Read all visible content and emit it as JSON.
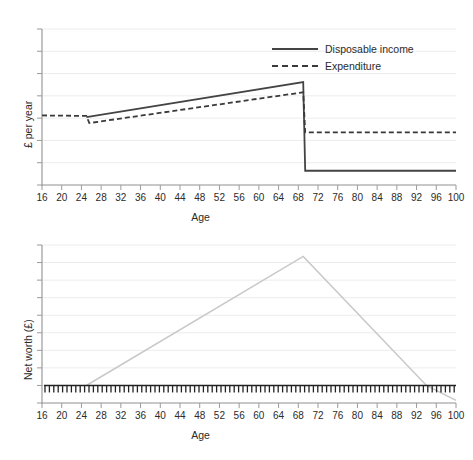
{
  "chart_data": [
    {
      "type": "line",
      "title": "",
      "xlabel": "Age",
      "ylabel": "£ per year",
      "xlim": [
        16,
        100
      ],
      "xticks": [
        16,
        20,
        24,
        28,
        32,
        36,
        40,
        44,
        48,
        52,
        56,
        60,
        64,
        68,
        72,
        76,
        80,
        84,
        88,
        92,
        96,
        100
      ],
      "ylim": [
        0,
        7
      ],
      "yticks_count": 7,
      "ytick_labels": [],
      "grid": true,
      "legend": {
        "position": "top-right",
        "entries": [
          {
            "label": "Disposable income",
            "style": "solid",
            "color": "#444444"
          },
          {
            "label": "Expenditure",
            "style": "dashed",
            "color": "#3a3a3a"
          }
        ]
      },
      "series": [
        {
          "name": "Disposable income",
          "style": "solid",
          "color": "#444444",
          "points": [
            {
              "x": 25,
              "y": 3.05
            },
            {
              "x": 69,
              "y": 4.62
            },
            {
              "x": 69.4,
              "y": 0.64
            },
            {
              "x": 100,
              "y": 0.64
            }
          ]
        },
        {
          "name": "Expenditure",
          "style": "dashed",
          "color": "#3a3a3a",
          "points": [
            {
              "x": 16,
              "y": 3.12
            },
            {
              "x": 25,
              "y": 3.1
            },
            {
              "x": 25.6,
              "y": 2.78
            },
            {
              "x": 69,
              "y": 4.16
            },
            {
              "x": 69.4,
              "y": 2.36
            },
            {
              "x": 100,
              "y": 2.36
            }
          ]
        }
      ],
      "annotations": [
        "Disposable income rises from age 25 to a peak at age 69, then falls sharply at retirement.",
        "Expenditure tracks below income and falls to a modest flat level after retirement."
      ]
    },
    {
      "type": "line",
      "title": "",
      "xlabel": "Age",
      "ylabel": "Net worth (£)",
      "xlim": [
        16,
        100
      ],
      "xticks": [
        16,
        20,
        24,
        28,
        32,
        36,
        40,
        44,
        48,
        52,
        56,
        60,
        64,
        68,
        72,
        76,
        80,
        84,
        88,
        92,
        96,
        100
      ],
      "ylim": [
        -1,
        8
      ],
      "yticks_count": 9,
      "ytick_labels": [],
      "grid": true,
      "zero_line": {
        "value": 0,
        "style": "hatched",
        "color": "#222222"
      },
      "series": [
        {
          "name": "Net worth",
          "style": "solid",
          "color": "#c9c9c9",
          "points": [
            {
              "x": 25,
              "y": 0
            },
            {
              "x": 69,
              "y": 7.35
            },
            {
              "x": 94,
              "y": 0
            },
            {
              "x": 100,
              "y": -0.85
            }
          ]
        }
      ],
      "annotations": [
        "Net worth is zero until age 25, climbs steadily to a peak at age 69, then declines, crossing zero near age 94."
      ]
    }
  ],
  "top_chart": {
    "ylabel": "£ per year",
    "xlabel": "Age",
    "legend": {
      "income_label": "Disposable income",
      "expenditure_label": "Expenditure"
    }
  },
  "bottom_chart": {
    "ylabel": "Net worth (£)",
    "xlabel": "Age"
  },
  "colors": {
    "axis": "#9a9a9a",
    "grid": "#ececec",
    "income_line": "#444444",
    "expenditure_line": "#3a3a3a",
    "networth_line": "#c9c9c9",
    "zero_line": "#222222",
    "text": "#2b2b2b"
  }
}
